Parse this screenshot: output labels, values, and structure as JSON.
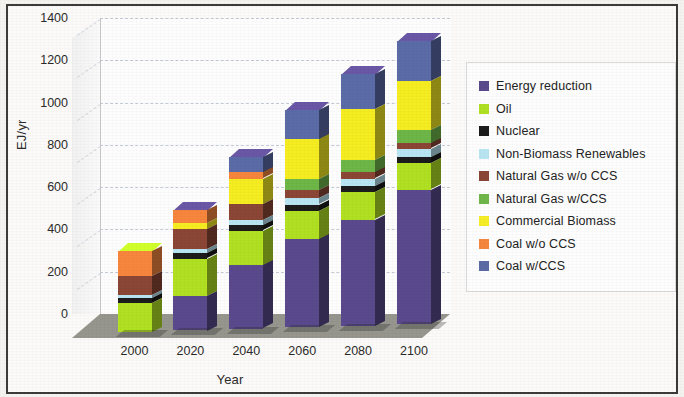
{
  "chart_data": {
    "type": "bar",
    "subtype": "stacked-column-3d",
    "title": "",
    "xlabel": "Year",
    "ylabel": "EJ/yr",
    "categories": [
      "2000",
      "2020",
      "2040",
      "2060",
      "2080",
      "2100"
    ],
    "ylim": [
      0,
      1400
    ],
    "yticks": [
      0,
      200,
      400,
      600,
      800,
      1000,
      1200,
      1400
    ],
    "grid": true,
    "legend_position": "right",
    "stack_order_bottom_to_top": [
      "Coal w/CCS",
      "Coal w/o CCS",
      "Commercial Biomass",
      "Natural Gas w/CCS",
      "Natural Gas w/o CCS",
      "Non-Biomass Renewables",
      "Nuclear",
      "Oil",
      "Energy reduction"
    ],
    "series": [
      {
        "name": "Coal w/CCS",
        "color": "#5b6ba6",
        "values": [
          0,
          0,
          75,
          140,
          165,
          190
        ]
      },
      {
        "name": "Coal w/o CCS",
        "color": "#f5863f",
        "values": [
          120,
          60,
          30,
          0,
          0,
          0
        ]
      },
      {
        "name": "Commercial Biomass",
        "color": "#f5ed25",
        "values": [
          0,
          30,
          120,
          190,
          240,
          230
        ]
      },
      {
        "name": "Natural Gas w/CCS",
        "color": "#6fb64a",
        "values": [
          0,
          0,
          0,
          50,
          60,
          65
        ]
      },
      {
        "name": "Natural Gas w/o CCS",
        "color": "#8a4636",
        "values": [
          90,
          95,
          75,
          40,
          30,
          25
        ]
      },
      {
        "name": "Non-Biomass Renewables",
        "color": "#b9e5f2",
        "values": [
          15,
          20,
          25,
          30,
          35,
          40
        ]
      },
      {
        "name": "Nuclear",
        "color": "#1c1c1c",
        "values": [
          25,
          25,
          25,
          30,
          30,
          30
        ]
      },
      {
        "name": "Oil",
        "color": "#b0e024",
        "values": [
          135,
          175,
          165,
          135,
          130,
          125
        ]
      },
      {
        "name": "Energy reduction",
        "color": "#5a4a8c",
        "values": [
          0,
          165,
          300,
          415,
          500,
          635
        ]
      }
    ],
    "totals": [
      385,
      570,
      815,
      1030,
      1190,
      1340
    ]
  },
  "axes": {
    "y_title": "EJ/yr",
    "x_title": "Year",
    "y_tick_labels": [
      "1400",
      "1200",
      "1000",
      "800",
      "600",
      "400",
      "200",
      "0"
    ],
    "x_tick_labels": [
      "2000",
      "2020",
      "2040",
      "2060",
      "2080",
      "2100"
    ]
  },
  "legend": {
    "items": [
      {
        "label": "Energy reduction",
        "color": "#5a4a8c"
      },
      {
        "label": "Oil",
        "color": "#b0e024"
      },
      {
        "label": "Nuclear",
        "color": "#1c1c1c"
      },
      {
        "label": "Non-Biomass Renewables",
        "color": "#b9e5f2"
      },
      {
        "label": "Natural Gas w/o CCS",
        "color": "#8a4636"
      },
      {
        "label": "Natural Gas w/CCS",
        "color": "#6fb64a"
      },
      {
        "label": "Commercial Biomass",
        "color": "#f5ed25"
      },
      {
        "label": "Coal w/o CCS",
        "color": "#f5863f"
      },
      {
        "label": "Coal w/CCS",
        "color": "#5b6ba6"
      }
    ]
  }
}
